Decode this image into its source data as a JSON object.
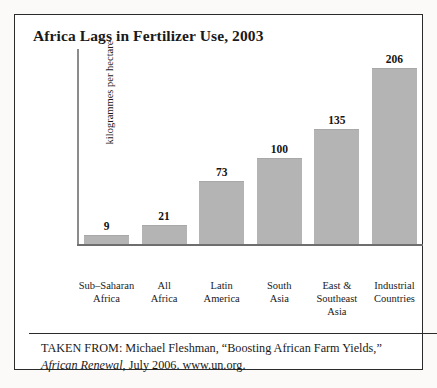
{
  "figure": {
    "title": "Africa Lags in Fertilizer Use, 2003",
    "caption_line1": "TAKEN FROM: Michael Fleshman, “Boosting African Farm Yields,”",
    "caption_source_italic": "African Renewal",
    "caption_line2_rest": ", July 2006. www.un.org.",
    "border_color": "#2b2b2b",
    "bar_color": "#b4b4b4"
  },
  "chart_data": {
    "type": "bar",
    "title": "Africa Lags in Fertilizer Use, 2003",
    "xlabel": "",
    "ylabel": "kilogrammes per hectare",
    "categories": [
      "Sub–Saharan Africa",
      "All Africa",
      "Latin America",
      "South Asia",
      "East & Southeast Asia",
      "Industrial Countries"
    ],
    "category_lines": [
      [
        "Sub–Saharan",
        "Africa"
      ],
      [
        "All",
        "Africa"
      ],
      [
        "Latin",
        "America"
      ],
      [
        "South",
        "Asia"
      ],
      [
        "East &",
        "Southeast",
        "Asia"
      ],
      [
        "Industrial",
        "Countries"
      ]
    ],
    "values": [
      9,
      21,
      73,
      100,
      135,
      206
    ],
    "value_labels": [
      "9",
      "21",
      "73",
      "100",
      "135",
      "206"
    ],
    "ylim": [
      0,
      230
    ],
    "grid": false,
    "legend": null
  }
}
